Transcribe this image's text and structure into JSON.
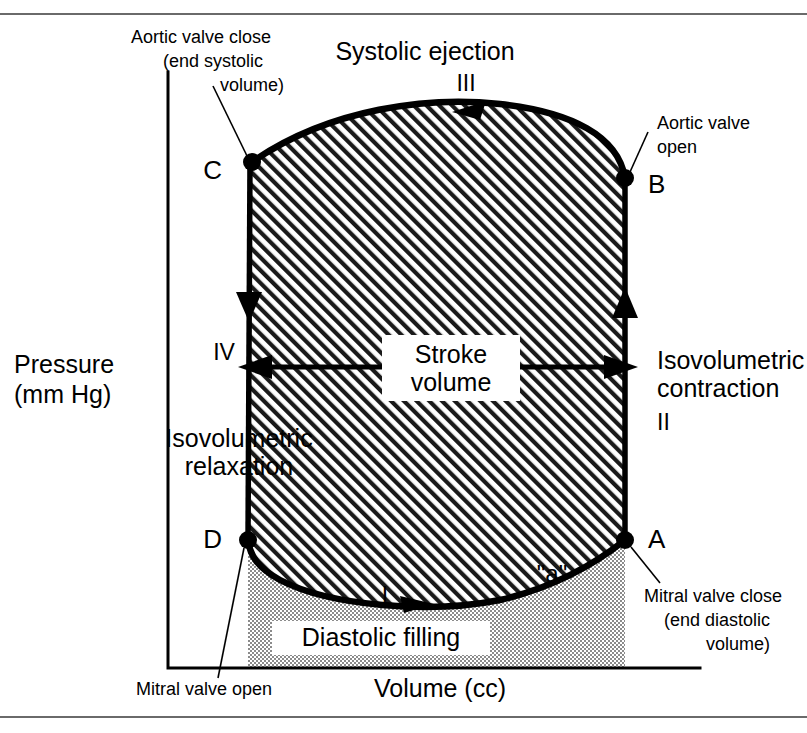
{
  "figure": {
    "axes": {
      "y_label_line1": "Pressure",
      "y_label_line2": "(mm Hg)",
      "x_label": "Volume (cc)"
    },
    "phases": [
      {
        "id": "I",
        "roman": "I",
        "name": "Diastolic filling"
      },
      {
        "id": "II",
        "roman": "II",
        "name_line1": "Isovolumetric",
        "name_line2": "contraction"
      },
      {
        "id": "III",
        "roman": "III",
        "name": "Systolic ejection"
      },
      {
        "id": "IV",
        "roman": "IV",
        "name_line1": "Isovolumetric",
        "name_line2": "relaxation"
      }
    ],
    "points": [
      {
        "letter": "A",
        "callout_line1": "Mitral valve close",
        "callout_line2": "(end diastolic",
        "callout_line3": "volume)"
      },
      {
        "letter": "B",
        "callout_line1": "Aortic valve",
        "callout_line2": "open"
      },
      {
        "letter": "C",
        "callout_line1": "Aortic valve close",
        "callout_line2": "(end systolic",
        "callout_line3": "volume)"
      },
      {
        "letter": "D",
        "callout_line1": "Mitral valve open"
      }
    ],
    "annotations": {
      "stroke_volume_line1": "Stroke",
      "stroke_volume_line2": "volume",
      "a_wave": "\"a\"",
      "diastolic_filling": "Diastolic filling"
    },
    "colors": {
      "ink": "#000000",
      "paper": "#ffffff",
      "hatch": "#1a1a1a",
      "stipple": "#8f8f8f",
      "rule": "#6a6a6a"
    }
  }
}
